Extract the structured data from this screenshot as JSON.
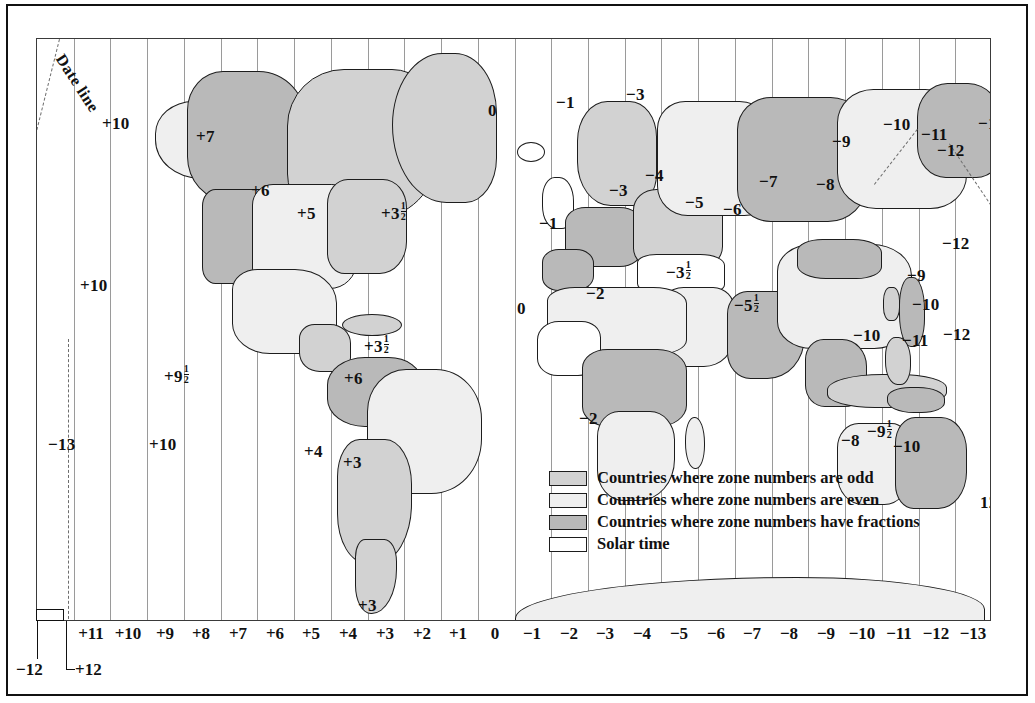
{
  "map": {
    "title": "World Standard Time Zones",
    "dateline_label": "Date line",
    "legend": [
      {
        "label": "Countries where zone numbers are odd",
        "swatch": "#d2d2d2",
        "name": "legend-odd"
      },
      {
        "label": "Countries where zone numbers are even",
        "swatch": "#efefef",
        "name": "legend-even"
      },
      {
        "label": "Countries where zone numbers have fractions",
        "swatch": "#b9b9b9",
        "name": "legend-fractions"
      },
      {
        "label": "Solar time",
        "swatch": "#ffffff",
        "name": "legend-solar"
      }
    ],
    "axis": {
      "left_corner": "−12",
      "left_corner2": "+12",
      "ticks": [
        "+11",
        "+10",
        "+9",
        "+8",
        "+7",
        "+6",
        "+5",
        "+4",
        "+3",
        "+2",
        "+1",
        "0",
        "−1",
        "−2",
        "−3",
        "−4",
        "−5",
        "−6",
        "−7",
        "−8",
        "−9",
        "−10",
        "−11",
        "−12",
        "−13"
      ]
    },
    "zone_labels": [
      {
        "text": "+10",
        "x": 101,
        "y": 113
      },
      {
        "text": "+7",
        "x": 195,
        "y": 126
      },
      {
        "text": "+6",
        "x": 250,
        "y": 180
      },
      {
        "text": "+5",
        "x": 296,
        "y": 203
      },
      {
        "text": "+3",
        "frac": "1/2",
        "x": 380,
        "y": 200
      },
      {
        "text": "+10",
        "x": 79,
        "y": 275
      },
      {
        "text": "+3",
        "frac": "1/2",
        "x": 363,
        "y": 333
      },
      {
        "text": "+9",
        "frac": "1/2",
        "x": 163,
        "y": 363
      },
      {
        "text": "+6",
        "x": 343,
        "y": 368
      },
      {
        "text": "−13",
        "x": 47,
        "y": 434
      },
      {
        "text": "+10",
        "x": 148,
        "y": 434
      },
      {
        "text": "+4",
        "x": 303,
        "y": 441
      },
      {
        "text": "+3",
        "x": 342,
        "y": 452
      },
      {
        "text": "+3",
        "x": 357,
        "y": 595
      },
      {
        "text": "0",
        "x": 487,
        "y": 100
      },
      {
        "text": "−1",
        "x": 555,
        "y": 92
      },
      {
        "text": "−3",
        "x": 625,
        "y": 84
      },
      {
        "text": "−9",
        "x": 831,
        "y": 131
      },
      {
        "text": "−10",
        "x": 882,
        "y": 114
      },
      {
        "text": "−11",
        "x": 920,
        "y": 124
      },
      {
        "text": "−13",
        "x": 977,
        "y": 113
      },
      {
        "text": "−12",
        "x": 936,
        "y": 140
      },
      {
        "text": "−4",
        "x": 644,
        "y": 165
      },
      {
        "text": "−3",
        "x": 608,
        "y": 180
      },
      {
        "text": "−5",
        "x": 684,
        "y": 192
      },
      {
        "text": "−6",
        "x": 722,
        "y": 199
      },
      {
        "text": "−7",
        "x": 758,
        "y": 171
      },
      {
        "text": "−8",
        "x": 815,
        "y": 174
      },
      {
        "text": "−1",
        "x": 538,
        "y": 213
      },
      {
        "text": "−12",
        "x": 941,
        "y": 233
      },
      {
        "text": "−9",
        "x": 906,
        "y": 265
      },
      {
        "text": "−3",
        "frac": "1/2",
        "x": 665,
        "y": 259
      },
      {
        "text": "−2",
        "x": 585,
        "y": 283
      },
      {
        "text": "0",
        "x": 516,
        "y": 298
      },
      {
        "text": "−5",
        "frac": "1/2",
        "x": 733,
        "y": 292
      },
      {
        "text": "−10",
        "x": 911,
        "y": 294
      },
      {
        "text": "−10",
        "x": 852,
        "y": 325
      },
      {
        "text": "−11",
        "x": 901,
        "y": 330
      },
      {
        "text": "−12",
        "x": 942,
        "y": 324
      },
      {
        "text": "−2",
        "x": 578,
        "y": 408
      },
      {
        "text": "−9",
        "frac": "1/2",
        "x": 866,
        "y": 418
      },
      {
        "text": "−8",
        "x": 840,
        "y": 430
      },
      {
        "text": "−10",
        "x": 892,
        "y": 436
      },
      {
        "text": "12",
        "x": 979,
        "y": 492
      }
    ]
  }
}
